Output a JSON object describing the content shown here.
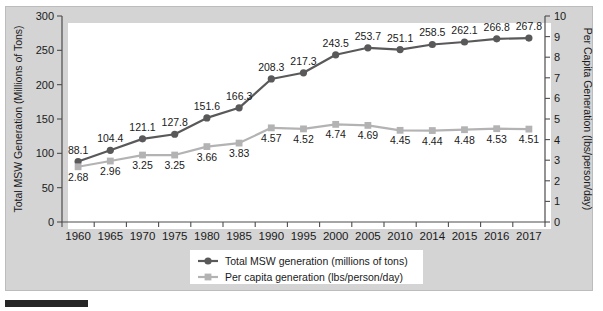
{
  "chart_data": {
    "type": "line",
    "title": "",
    "xlabel": "",
    "categories": [
      "1960",
      "1965",
      "1970",
      "1975",
      "1980",
      "1985",
      "1990",
      "1995",
      "2000",
      "2005",
      "2010",
      "2014",
      "2015",
      "2016",
      "2017"
    ],
    "series": [
      {
        "name": "Total MSW generation (millions of tons)",
        "axis": "left",
        "color": "#595959",
        "marker": "circle",
        "values": [
          88.1,
          104.4,
          121.1,
          127.8,
          151.6,
          166.3,
          208.3,
          217.3,
          243.5,
          253.7,
          251.1,
          258.5,
          262.1,
          266.8,
          267.8
        ],
        "labels": [
          "88.1",
          "104.4",
          "121.1",
          "127.8",
          "151.6",
          "166.3",
          "208.3",
          "217.3",
          "243.5",
          "253.7",
          "251.1",
          "258.5",
          "262.1",
          "266.8",
          "267.8"
        ]
      },
      {
        "name": "Per capita generation (lbs/person/day)",
        "axis": "right",
        "color": "#b3b3b3",
        "marker": "square",
        "values": [
          2.68,
          2.96,
          3.25,
          3.25,
          3.66,
          3.83,
          4.57,
          4.52,
          4.74,
          4.69,
          4.45,
          4.44,
          4.48,
          4.53,
          4.51
        ],
        "labels": [
          "2.68",
          "2.96",
          "3.25",
          "3.25",
          "3.66",
          "3.83",
          "4.57",
          "4.52",
          "4.74",
          "4.69",
          "4.45",
          "4.44",
          "4.48",
          "4.53",
          "4.51"
        ]
      }
    ],
    "left_axis": {
      "label": "Total MSW Generation (Millions of Tons)",
      "ticks": [
        "0",
        "50",
        "100",
        "150",
        "200",
        "250",
        "300"
      ],
      "min": 0,
      "max": 300
    },
    "right_axis": {
      "label": "Per Capita Generation (lbs/person/day)",
      "ticks": [
        "0",
        "1",
        "2",
        "3",
        "4",
        "5",
        "6",
        "7",
        "8",
        "9",
        "10"
      ],
      "min": 0,
      "max": 10
    },
    "legend": {
      "position": "bottom",
      "entries": [
        {
          "label": "Total MSW generation (millions of tons)",
          "color": "#595959",
          "marker": "circle"
        },
        {
          "label": "Per capita generation (lbs/person/day)",
          "color": "#b3b3b3",
          "marker": "square"
        }
      ]
    },
    "grid": false,
    "background": "#d4d4d4",
    "plot_background": "#ffffff"
  }
}
